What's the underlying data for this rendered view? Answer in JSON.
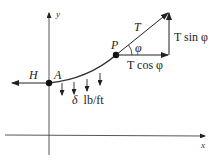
{
  "diagram": {
    "axes": {
      "x_label": "x",
      "y_label": "y"
    },
    "points": {
      "A": "A",
      "P": "P"
    },
    "forces": {
      "horizontal_tension": "H",
      "tension": "T",
      "tension_horizontal_component": "T cos φ",
      "tension_vertical_component": "T sin φ",
      "angle": "φ"
    },
    "load": {
      "symbol": "δ",
      "units": "lb/ft"
    }
  }
}
